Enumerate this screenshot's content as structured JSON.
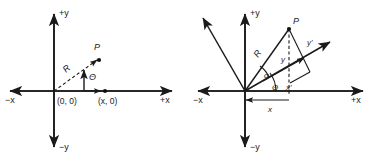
{
  "figure": {
    "background_color": "#ffffff",
    "stroke_color": "#1a1a1a",
    "panels": [
      {
        "id": "left",
        "name": "cartesian-polar-point",
        "axis_labels": {
          "pos_y": "+y",
          "neg_y": "−y",
          "pos_x": "+x",
          "neg_x": "−x"
        },
        "labels": {
          "point_p": "P",
          "radius": "R",
          "angle": "Θ",
          "origin_coord": "(0, 0)",
          "x_coord": "(x, 0)"
        }
      },
      {
        "id": "right",
        "name": "rotated-axes-point",
        "axis_labels": {
          "pos_y": "+y",
          "neg_y": "−y",
          "pos_x": "+x",
          "neg_x": "−x"
        },
        "labels": {
          "point_p": "P",
          "radius": "R",
          "alpha": "α",
          "theta": "Θ",
          "x_prime": "x'",
          "y_prime": "y'",
          "y_comp": "y",
          "x_comp": "x"
        }
      }
    ]
  }
}
